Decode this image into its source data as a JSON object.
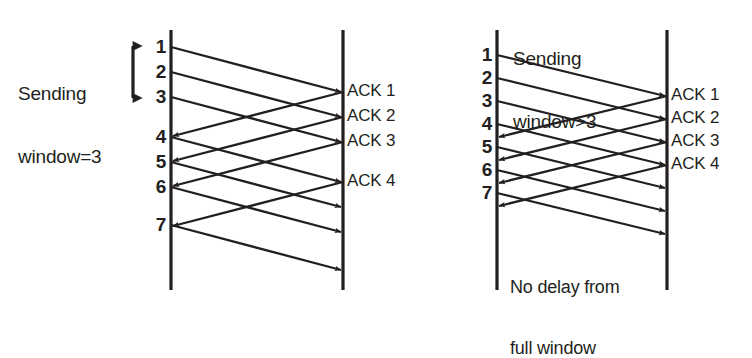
{
  "figure": {
    "type": "sequence-timing-diagram",
    "panels": [
      {
        "id": "left",
        "annotation": {
          "line1": "Sending",
          "line2": "window=3",
          "marker": "double-headed-vertical-arrow"
        },
        "sender_label": "sender-timeline",
        "receiver_label": "receiver-timeline",
        "sequence_numbers": [
          "1",
          "2",
          "3",
          "4",
          "5",
          "6",
          "7"
        ],
        "ack_labels": [
          "ACK 1",
          "ACK 2",
          "ACK 3",
          "ACK 4"
        ],
        "note": null
      },
      {
        "id": "right",
        "annotation": {
          "line1": "Sending",
          "line2": "window>3",
          "marker": "none"
        },
        "sender_label": "sender-timeline",
        "receiver_label": "receiver-timeline",
        "sequence_numbers": [
          "1",
          "2",
          "3",
          "4",
          "5",
          "6",
          "7"
        ],
        "ack_labels": [
          "ACK 1",
          "ACK 2",
          "ACK 3",
          "ACK 4"
        ],
        "note": {
          "line1": "No delay from",
          "line2": "full window"
        }
      }
    ],
    "colors": {
      "ink": "#231f20",
      "background": "#ffffff"
    }
  }
}
